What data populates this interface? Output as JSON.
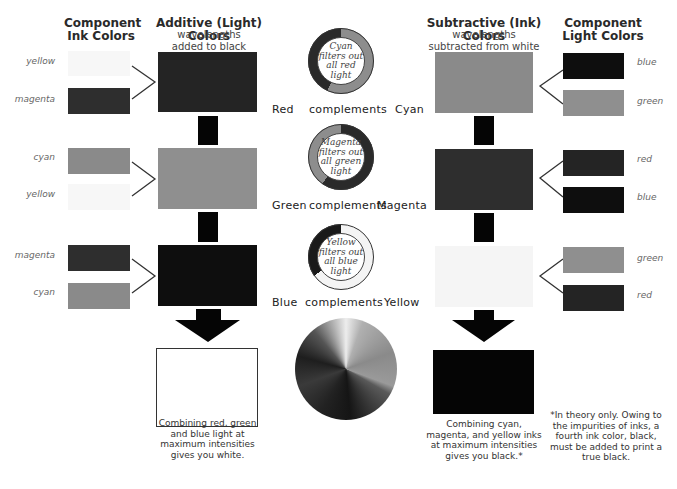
{
  "headers": {
    "component_ink": "Component\nInk Colors",
    "additive_title": "Additive (Light) Colors",
    "additive_sub": "wavelengths\nadded to black",
    "subtractive_title": "Subtractive (Ink) Colors",
    "subtractive_sub": "wavelengths\nsubtracted from white",
    "component_light": "Component\nLight Colors"
  },
  "colors": {
    "yellow": "#f7f7f7",
    "magenta": "#2e2e2e",
    "cyan": "#8a8a8a",
    "red": "#242424",
    "green": "#8f8f8f",
    "blue": "#0e0e0e",
    "black": "#050505",
    "white": "#ffffff"
  },
  "left": {
    "rows": [
      {
        "top_label": "yellow",
        "bottom_label": "magenta",
        "result": "Red"
      },
      {
        "top_label": "cyan",
        "bottom_label": "yellow",
        "result": "Green"
      },
      {
        "top_label": "magenta",
        "bottom_label": "cyan",
        "result": "Blue"
      }
    ]
  },
  "right": {
    "rows": [
      {
        "top_label": "blue",
        "bottom_label": "green",
        "result": "Cyan"
      },
      {
        "top_label": "red",
        "bottom_label": "blue",
        "result": "Magenta"
      },
      {
        "top_label": "green",
        "bottom_label": "red",
        "result": "Yellow"
      }
    ]
  },
  "middle": {
    "rings": [
      {
        "text": "Cyan\nfilters out\nall red\nlight",
        "left": "Red",
        "mid": "complements",
        "right": "Cyan"
      },
      {
        "text": "Magenta\nfilters out\nall green\nlight",
        "left": "Green",
        "mid": "complements",
        "right": "Magenta"
      },
      {
        "text": "Yellow\nfilters out\nall blue\nlight",
        "left": "Blue",
        "mid": "complements",
        "right": "Yellow"
      }
    ]
  },
  "captions": {
    "additive_result": "Combining red, green\nand blue light at\nmaximum intensities\ngives you white.",
    "subtractive_result": "Combining cyan,\nmagenta, and yellow inks\nat maximum intensities\ngives you black.*",
    "footnote": "*In theory only. Owing to\nthe impurities of inks, a\nfourth ink color, black,\nmust be added to print a\ntrue black."
  }
}
